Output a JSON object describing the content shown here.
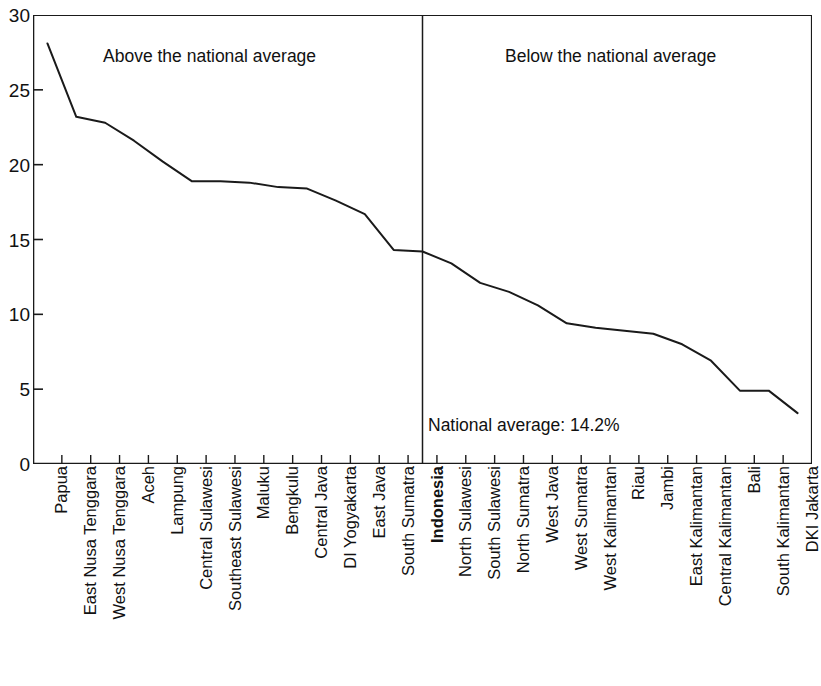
{
  "chart_data": {
    "type": "line",
    "title": "",
    "subtitle": "",
    "xlabel": "",
    "ylabel": "",
    "ylim": [
      0,
      30
    ],
    "yticks": [
      0,
      5,
      10,
      15,
      20,
      25,
      30
    ],
    "ytick_labels": [
      "0",
      "5",
      "10",
      "15",
      "20",
      "25",
      "30"
    ],
    "grid": false,
    "legend_position": "none",
    "line_color": "#1a1a1a",
    "categories": [
      "Papua",
      "East Nusa Tenggara",
      "West Nusa Tenggara",
      "Aceh",
      "Lampung",
      "Central Sulawesi",
      "Southeast Sulawesi",
      "Maluku",
      "Bengkulu",
      "Central Java",
      "DI Yogyakarta",
      "East Java",
      "South Sumatra",
      "Indonesia",
      "North Sulawesi",
      "South Sulawesi",
      "North Sumatra",
      "West Java",
      "West Sumatra",
      "West Kalimantan",
      "Riau",
      "Jambi",
      "East Kalimantan",
      "Central Kalimantan",
      "Bali",
      "South Kalimantan",
      "DKI Jakarta"
    ],
    "values": [
      28.1,
      23.2,
      22.8,
      21.6,
      20.2,
      18.9,
      18.9,
      18.8,
      18.5,
      18.4,
      17.6,
      16.7,
      14.3,
      14.2,
      13.4,
      12.1,
      11.5,
      10.6,
      9.4,
      9.1,
      8.9,
      8.7,
      8.0,
      6.9,
      4.9,
      4.9,
      3.4
    ],
    "annotations": [
      {
        "name": "above-the-national-average",
        "text": "Above the national average"
      },
      {
        "name": "below-the-national-average",
        "text": "Below the national average"
      },
      {
        "name": "national-average-value",
        "text": "National average: 14.2%"
      }
    ],
    "reference_line": {
      "name": "national-average-divider",
      "at_category": "Indonesia",
      "value": 14.2,
      "orientation": "vertical"
    },
    "highlighted_category": "Indonesia"
  },
  "annotations": {
    "above": "Above the national average",
    "below": "Below the national average",
    "national_average": "National average: 14.2%"
  }
}
